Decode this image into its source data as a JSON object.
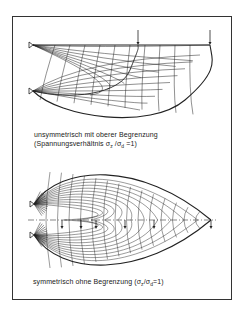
{
  "figure": {
    "frame_color": "#333333",
    "line_color": "#222222",
    "background": "#ffffff"
  },
  "top_diagram": {
    "caption_line1": "unsymmetrisch mit oberer Begrenzung",
    "caption_line2_prefix": "(Spannungsverhältnis  σ",
    "caption_line2_sub1": "z",
    "caption_line2_mid": " /σ",
    "caption_line2_sub2": "d",
    "caption_line2_suffix": " =1)",
    "supports": [
      {
        "x": 33,
        "y": 45
      },
      {
        "x": 33,
        "y": 91
      }
    ],
    "top_boundary": {
      "x1": 33,
      "x2": 210,
      "y": 45
    },
    "load_arrows": [
      {
        "x": 138,
        "y1": 30,
        "y2": 45
      },
      {
        "x": 210,
        "y1": 30,
        "y2": 45
      }
    ]
  },
  "bottom_diagram": {
    "caption_prefix": "symmetrisch  ohne Begrenzung (σ",
    "caption_sub1": "z",
    "caption_mid": "/σ",
    "caption_sub2": "d",
    "caption_suffix": "=1)",
    "supports": [
      {
        "x": 34,
        "y": 204
      },
      {
        "x": 34,
        "y": 235
      }
    ],
    "symmetry_axis": {
      "x1": 28,
      "x2": 216,
      "y": 220
    },
    "tip": {
      "x": 211,
      "y": 220
    },
    "load_arrow_x": [
      62,
      81,
      96,
      125,
      154,
      211
    ]
  }
}
